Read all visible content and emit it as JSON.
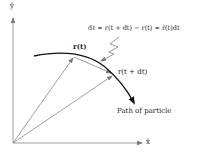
{
  "diagram": {
    "axes": {
      "y_label": "ŷ",
      "x_label": "x̂"
    },
    "labels": {
      "r_t": "r(t)",
      "r_t_dt": "r(t + dt)",
      "equation": "dℓ ≈ r(t + dt) − r(t) ≈ ṙ(t)dt",
      "path": "Path of particle"
    },
    "colors": {
      "axis": "#888888",
      "vector": "#666666",
      "curve": "#111111",
      "text": "#222222"
    }
  }
}
